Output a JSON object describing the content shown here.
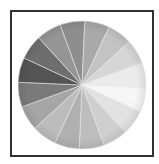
{
  "chart_data": {
    "type": "pie",
    "title": "",
    "categories": [
      "1",
      "2",
      "3",
      "4",
      "5",
      "6",
      "7",
      "8",
      "9",
      "10",
      "11",
      "12",
      "13",
      "14",
      "15",
      "16"
    ],
    "values": [
      1,
      1,
      1,
      1,
      1,
      1,
      1,
      1,
      1,
      1,
      1,
      1,
      1,
      1,
      1,
      1
    ],
    "start_angle_deg": -20,
    "colors": [
      "#8e8e8e",
      "#a9a9a9",
      "#c3c3c3",
      "#d6d6d6",
      "#ebebeb",
      "#f6f6f6",
      "#e2e2e2",
      "#cfcfcf",
      "#bdbdbd",
      "#b0b0b0",
      "#bcbcbc",
      "#a6a6a6",
      "#7a7a7a",
      "#545454",
      "#6e6e6e",
      "#959595"
    ],
    "separator_color": "#e8e8e8",
    "center": [
      82,
      85
    ],
    "radius": 64,
    "legend": [],
    "xlabel": "",
    "ylabel": ""
  },
  "frame": {
    "border_color": "#333333"
  }
}
